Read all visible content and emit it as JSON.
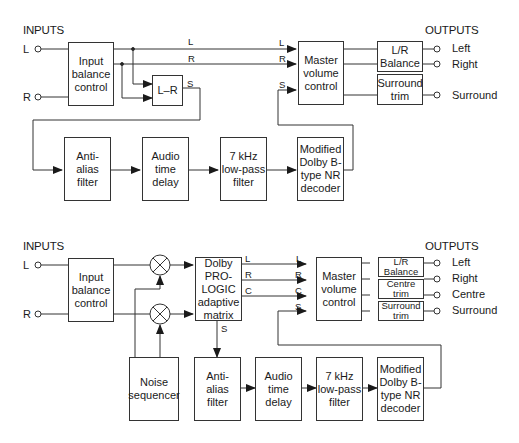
{
  "top": {
    "inputs_header": "INPUTS",
    "outputs_header": "OUTPUTS",
    "input_L": "L",
    "input_R": "R",
    "blocks": {
      "input_balance": "Input\nbalance\ncontrol",
      "l_minus_r": "L–R",
      "master_volume": "Master\nvolume\ncontrol",
      "lr_balance": "L/R\nBalance",
      "surround_trim": "Surround\ntrim",
      "anti_alias": "Anti-\nalias\nfilter",
      "audio_delay": "Audio\ntime\ndelay",
      "lowpass": "7 kHz\nlow-pass\nfilter",
      "nr_decoder": "Modified\nDolby B-\ntype NR\ndecoder"
    },
    "signals": {
      "L": "L",
      "R": "R",
      "S": "S",
      "L_in": "L",
      "R_in": "R",
      "S_in": "S"
    },
    "outputs": [
      "Left",
      "Right",
      "Surround"
    ]
  },
  "bottom": {
    "inputs_header": "INPUTS",
    "outputs_header": "OUTPUTS",
    "input_L": "L",
    "input_R": "R",
    "blocks": {
      "input_balance": "Input\nbalance\ncontrol",
      "prologic": "Dolby\nPRO-\nLOGIC\nadaptive\nmatrix",
      "noise_sequencer": "Noise\nsequencer",
      "master_volume": "Master\nvolume\ncontrol",
      "lr_balance": "L/R\nBalance",
      "centre_trim": "Centre\ntrim",
      "surround_trim": "Surround\ntrim",
      "anti_alias": "Anti-\nalias\nfilter",
      "audio_delay": "Audio\ntime\ndelay",
      "lowpass": "7 kHz\nlow-pass\nfilter",
      "nr_decoder": "Modified\nDolby B-\ntype NR\ndecoder"
    },
    "signals": {
      "L": "L",
      "R": "R",
      "C": "C",
      "S": "S",
      "L_in": "L",
      "R_in": "R",
      "C_in": "C",
      "S_in": "S"
    },
    "outputs": [
      "Left",
      "Right",
      "Centre",
      "Surround"
    ]
  }
}
